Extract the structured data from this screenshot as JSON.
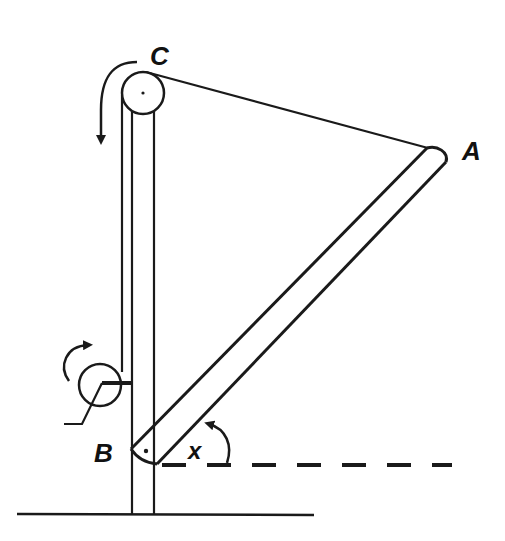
{
  "diagram": {
    "labels": {
      "pulley": "C",
      "rod_top": "A",
      "rod_pivot": "B",
      "angle": "x"
    },
    "colors": {
      "stroke": "#1a1a1a",
      "background": "#ffffff"
    },
    "elements": [
      "ground-line",
      "vertical-post",
      "pulley",
      "rope",
      "winch",
      "winch-crank",
      "rod",
      "horizontal-reference-dashed",
      "angle-arrow",
      "pulley-rotation-arrow",
      "winch-rotation-arrow"
    ]
  }
}
